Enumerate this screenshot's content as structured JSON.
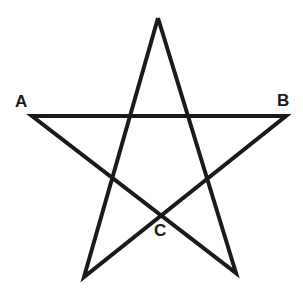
{
  "diagram": {
    "type": "pentagram",
    "stroke_color": "#1a1a1a",
    "background": "#ffffff",
    "vertices": {
      "top": [
        158,
        18
      ],
      "left": [
        32,
        116
      ],
      "right": [
        286,
        116
      ],
      "bottom_left": [
        84,
        277
      ],
      "bottom_right": [
        236,
        273
      ]
    },
    "labels": [
      {
        "id": "A",
        "text": "A",
        "x": 15,
        "y": 93
      },
      {
        "id": "B",
        "text": "B",
        "x": 277,
        "y": 92
      },
      {
        "id": "C",
        "text": "C",
        "x": 154,
        "y": 222
      }
    ]
  }
}
